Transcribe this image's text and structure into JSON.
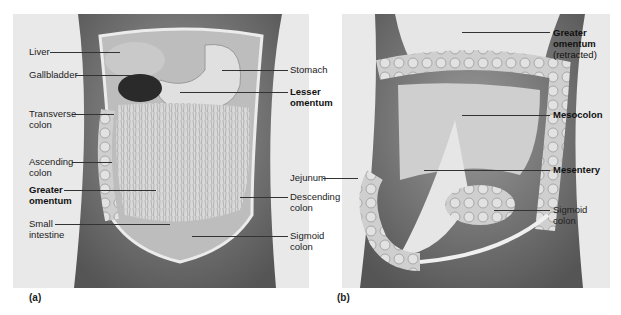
{
  "panels": [
    {
      "id": "a",
      "caption": "(a)",
      "labels": [
        {
          "name": "liver",
          "lines": [
            "Liver"
          ],
          "bold": false
        },
        {
          "name": "gallbladder",
          "lines": [
            "Gallbladder"
          ],
          "bold": false
        },
        {
          "name": "transverse-colon",
          "lines": [
            "Transverse",
            "colon"
          ],
          "bold": false
        },
        {
          "name": "ascending-colon",
          "lines": [
            "Ascending",
            "colon"
          ],
          "bold": false
        },
        {
          "name": "greater-omentum",
          "lines": [
            "Greater",
            "omentum"
          ],
          "bold": true
        },
        {
          "name": "small-intestine",
          "lines": [
            "Small",
            "intestine"
          ],
          "bold": false
        },
        {
          "name": "stomach",
          "lines": [
            "Stomach"
          ],
          "bold": false
        },
        {
          "name": "lesser-omentum",
          "lines": [
            "Lesser",
            "omentum"
          ],
          "bold": true
        },
        {
          "name": "descending-colon",
          "lines": [
            "Descending",
            "colon"
          ],
          "bold": false
        },
        {
          "name": "sigmoid-colon",
          "lines": [
            "Sigmoid",
            "colon"
          ],
          "bold": false
        }
      ]
    },
    {
      "id": "b",
      "caption": "(b)",
      "labels": [
        {
          "name": "jejunum",
          "lines": [
            "Jejunum"
          ],
          "bold": false
        },
        {
          "name": "greater-omentum-retracted",
          "lines": [
            "Greater",
            "omentum",
            "(retracted)"
          ],
          "bold": true
        },
        {
          "name": "mesocolon",
          "lines": [
            "Mesocolon"
          ],
          "bold": true
        },
        {
          "name": "mesentery",
          "lines": [
            "Mesentery"
          ],
          "bold": true
        },
        {
          "name": "sigmoid-colon",
          "lines": [
            "Sigmoid",
            "colon"
          ],
          "bold": false
        }
      ]
    }
  ],
  "colors": {
    "background": "#e9e9e9",
    "text": "#222222",
    "leader": "#333333"
  }
}
